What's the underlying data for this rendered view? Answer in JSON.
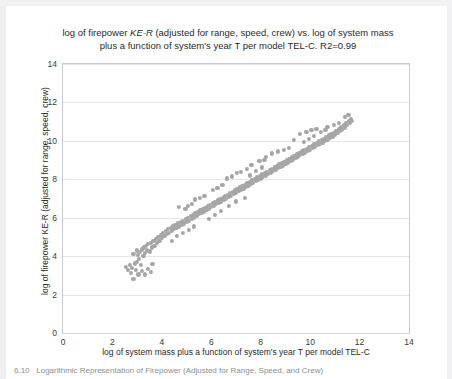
{
  "figure": {
    "title_line1_a": "log of firepower ",
    "title_line1_it": "KE-R",
    "title_line1_b": "  (adjusted for range, speed, crew) vs. log  of system mass",
    "title_line2": "plus a function of system's year T per model TEL-C. R2=0.99",
    "caption_number": "6.10",
    "caption_text": "Logarithmic Representation of Firepower (Adjusted for Range, Speed, and Crew)"
  },
  "chart_data": {
    "type": "scatter",
    "title": "log of firepower KE-R  (adjusted for range, speed, crew) vs. log  of system mass plus a function of system's year T per model TEL-C. R2=0.99",
    "xlabel": "log  of system mass plus  a function of system's year T per model TEL-C",
    "ylabel": "log of firepower KE-R  (adjusted for range, speed, crew)",
    "xlim": [
      0,
      14
    ],
    "ylim": [
      0,
      14
    ],
    "xticks": [
      0,
      2,
      4,
      6,
      8,
      10,
      12,
      14
    ],
    "yticks": [
      0,
      2,
      4,
      6,
      8,
      10,
      12,
      14
    ],
    "grid": "horizontal",
    "legend": "none",
    "marker_color": "#a6a6a6",
    "series": [
      {
        "name": "systems",
        "points": [
          [
            2.55,
            3.45
          ],
          [
            2.62,
            3.3
          ],
          [
            2.7,
            3.55
          ],
          [
            2.74,
            3.12
          ],
          [
            2.8,
            3.4
          ],
          [
            2.85,
            2.8
          ],
          [
            2.9,
            3.62
          ],
          [
            2.95,
            3.3
          ],
          [
            3.0,
            3.7
          ],
          [
            3.02,
            4.05
          ],
          [
            3.08,
            3.85
          ],
          [
            3.12,
            4.2
          ],
          [
            3.15,
            3.55
          ],
          [
            3.2,
            4.35
          ],
          [
            3.25,
            4.0
          ],
          [
            3.28,
            4.45
          ],
          [
            3.32,
            4.15
          ],
          [
            3.36,
            4.55
          ],
          [
            3.4,
            4.3
          ],
          [
            3.45,
            4.62
          ],
          [
            3.5,
            4.25
          ],
          [
            3.55,
            4.7
          ],
          [
            3.6,
            4.45
          ],
          [
            3.66,
            4.8
          ],
          [
            3.7,
            4.55
          ],
          [
            3.75,
            4.9
          ],
          [
            3.8,
            4.7
          ],
          [
            3.86,
            5.0
          ],
          [
            3.9,
            4.8
          ],
          [
            3.95,
            5.1
          ],
          [
            4.0,
            4.95
          ],
          [
            4.05,
            5.2
          ],
          [
            4.1,
            5.05
          ],
          [
            4.15,
            5.3
          ],
          [
            4.2,
            5.15
          ],
          [
            4.26,
            5.4
          ],
          [
            4.3,
            5.22
          ],
          [
            4.36,
            5.48
          ],
          [
            4.4,
            5.3
          ],
          [
            4.46,
            5.55
          ],
          [
            4.5,
            5.4
          ],
          [
            4.55,
            5.62
          ],
          [
            4.6,
            5.48
          ],
          [
            4.66,
            5.7
          ],
          [
            4.7,
            5.55
          ],
          [
            4.76,
            5.78
          ],
          [
            4.8,
            5.62
          ],
          [
            4.86,
            5.85
          ],
          [
            4.9,
            5.7
          ],
          [
            4.96,
            5.92
          ],
          [
            5.0,
            5.78
          ],
          [
            5.06,
            6.0
          ],
          [
            5.1,
            5.85
          ],
          [
            5.16,
            6.08
          ],
          [
            5.2,
            5.95
          ],
          [
            5.26,
            6.15
          ],
          [
            5.3,
            6.02
          ],
          [
            5.36,
            6.22
          ],
          [
            5.4,
            6.1
          ],
          [
            5.46,
            6.3
          ],
          [
            5.5,
            6.18
          ],
          [
            5.56,
            6.38
          ],
          [
            5.6,
            6.25
          ],
          [
            5.66,
            6.45
          ],
          [
            5.7,
            6.32
          ],
          [
            5.76,
            6.52
          ],
          [
            5.8,
            6.4
          ],
          [
            5.86,
            6.6
          ],
          [
            5.9,
            6.48
          ],
          [
            5.96,
            6.68
          ],
          [
            6.0,
            6.55
          ],
          [
            6.06,
            6.75
          ],
          [
            6.1,
            6.62
          ],
          [
            6.16,
            6.82
          ],
          [
            6.2,
            6.7
          ],
          [
            6.26,
            6.9
          ],
          [
            6.3,
            6.78
          ],
          [
            6.36,
            6.98
          ],
          [
            6.4,
            6.85
          ],
          [
            6.46,
            7.05
          ],
          [
            6.5,
            6.92
          ],
          [
            6.56,
            7.12
          ],
          [
            6.6,
            7.0
          ],
          [
            6.66,
            7.2
          ],
          [
            6.7,
            7.08
          ],
          [
            6.76,
            7.28
          ],
          [
            6.8,
            7.15
          ],
          [
            6.86,
            7.35
          ],
          [
            6.9,
            7.22
          ],
          [
            6.96,
            7.42
          ],
          [
            7.0,
            7.3
          ],
          [
            7.06,
            7.5
          ],
          [
            7.1,
            7.38
          ],
          [
            7.16,
            7.58
          ],
          [
            7.2,
            7.45
          ],
          [
            7.26,
            7.65
          ],
          [
            7.3,
            7.52
          ],
          [
            7.36,
            7.72
          ],
          [
            7.4,
            7.6
          ],
          [
            7.46,
            7.8
          ],
          [
            7.5,
            7.68
          ],
          [
            7.56,
            7.88
          ],
          [
            7.6,
            7.75
          ],
          [
            7.66,
            7.95
          ],
          [
            7.7,
            7.82
          ],
          [
            7.76,
            8.02
          ],
          [
            7.8,
            7.9
          ],
          [
            7.86,
            8.1
          ],
          [
            7.9,
            7.98
          ],
          [
            7.96,
            8.18
          ],
          [
            8.0,
            8.05
          ],
          [
            8.06,
            8.25
          ],
          [
            8.1,
            8.12
          ],
          [
            8.16,
            8.32
          ],
          [
            8.2,
            8.2
          ],
          [
            8.26,
            8.4
          ],
          [
            8.3,
            8.28
          ],
          [
            8.36,
            8.48
          ],
          [
            8.4,
            8.35
          ],
          [
            8.46,
            8.55
          ],
          [
            8.5,
            8.42
          ],
          [
            8.56,
            8.62
          ],
          [
            8.6,
            8.5
          ],
          [
            8.66,
            8.7
          ],
          [
            8.7,
            8.58
          ],
          [
            8.76,
            8.78
          ],
          [
            8.8,
            8.65
          ],
          [
            8.86,
            8.85
          ],
          [
            8.9,
            8.72
          ],
          [
            8.96,
            8.92
          ],
          [
            9.0,
            8.8
          ],
          [
            9.06,
            9.0
          ],
          [
            9.1,
            8.88
          ],
          [
            9.16,
            9.08
          ],
          [
            9.2,
            8.95
          ],
          [
            9.26,
            9.15
          ],
          [
            9.3,
            9.02
          ],
          [
            9.36,
            9.22
          ],
          [
            9.4,
            9.1
          ],
          [
            9.46,
            9.3
          ],
          [
            9.5,
            9.18
          ],
          [
            9.56,
            9.38
          ],
          [
            9.6,
            9.25
          ],
          [
            9.66,
            9.45
          ],
          [
            9.7,
            9.32
          ],
          [
            9.76,
            9.52
          ],
          [
            9.8,
            9.4
          ],
          [
            9.86,
            9.6
          ],
          [
            9.9,
            9.48
          ],
          [
            9.96,
            9.68
          ],
          [
            10.0,
            9.55
          ],
          [
            10.06,
            9.75
          ],
          [
            10.1,
            9.62
          ],
          [
            10.16,
            9.82
          ],
          [
            10.2,
            9.7
          ],
          [
            10.26,
            9.9
          ],
          [
            10.3,
            9.78
          ],
          [
            10.36,
            9.98
          ],
          [
            10.4,
            9.85
          ],
          [
            10.46,
            10.05
          ],
          [
            10.5,
            9.92
          ],
          [
            10.56,
            10.12
          ],
          [
            10.6,
            10.0
          ],
          [
            10.66,
            10.2
          ],
          [
            10.7,
            10.08
          ],
          [
            10.76,
            10.28
          ],
          [
            10.8,
            10.15
          ],
          [
            10.86,
            10.35
          ],
          [
            10.9,
            10.22
          ],
          [
            10.96,
            10.42
          ],
          [
            11.0,
            10.3
          ],
          [
            11.06,
            10.5
          ],
          [
            11.1,
            10.4
          ],
          [
            11.16,
            10.6
          ],
          [
            11.2,
            10.5
          ],
          [
            11.26,
            10.7
          ],
          [
            11.3,
            10.6
          ],
          [
            11.36,
            10.8
          ],
          [
            11.4,
            10.7
          ],
          [
            11.46,
            10.92
          ],
          [
            11.5,
            10.82
          ],
          [
            11.56,
            11.05
          ],
          [
            11.6,
            10.95
          ],
          [
            11.66,
            11.15
          ],
          [
            11.7,
            11.05
          ],
          [
            3.05,
            3.05
          ],
          [
            3.18,
            3.25
          ],
          [
            3.3,
            3.05
          ],
          [
            3.42,
            3.35
          ],
          [
            3.55,
            3.2
          ],
          [
            3.62,
            3.6
          ],
          [
            4.7,
            6.55
          ],
          [
            4.95,
            6.45
          ],
          [
            5.05,
            6.6
          ],
          [
            5.2,
            6.7
          ],
          [
            5.35,
            6.95
          ],
          [
            5.55,
            7.05
          ],
          [
            5.72,
            7.15
          ],
          [
            6.05,
            7.45
          ],
          [
            6.25,
            7.55
          ],
          [
            6.45,
            7.7
          ],
          [
            6.62,
            8.05
          ],
          [
            6.85,
            8.15
          ],
          [
            7.05,
            8.35
          ],
          [
            7.2,
            8.4
          ],
          [
            7.45,
            8.55
          ],
          [
            7.62,
            8.75
          ],
          [
            7.95,
            8.95
          ],
          [
            8.15,
            9.0
          ],
          [
            5.9,
            5.95
          ],
          [
            6.15,
            6.15
          ],
          [
            6.4,
            6.35
          ],
          [
            6.7,
            6.6
          ],
          [
            7.0,
            6.85
          ],
          [
            7.35,
            7.05
          ],
          [
            9.6,
            10.35
          ],
          [
            9.85,
            10.45
          ],
          [
            10.05,
            10.55
          ],
          [
            10.25,
            10.62
          ],
          [
            9.35,
            10.05
          ],
          [
            10.7,
            10.72
          ],
          [
            10.95,
            10.85
          ],
          [
            11.15,
            10.95
          ],
          [
            11.42,
            11.25
          ],
          [
            11.55,
            11.35
          ],
          [
            8.45,
            9.35
          ],
          [
            8.7,
            9.45
          ],
          [
            8.95,
            9.55
          ],
          [
            9.15,
            9.65
          ],
          [
            8.2,
            9.15
          ],
          [
            4.4,
            4.8
          ],
          [
            4.62,
            5.05
          ],
          [
            4.85,
            5.2
          ],
          [
            5.1,
            5.38
          ],
          [
            5.3,
            5.55
          ],
          [
            2.85,
            4.1
          ],
          [
            3.0,
            4.3
          ],
          [
            7.55,
            8.2
          ],
          [
            7.8,
            8.42
          ],
          [
            8.05,
            8.62
          ],
          [
            9.75,
            9.95
          ],
          [
            9.95,
            10.12
          ],
          [
            10.15,
            10.25
          ],
          [
            10.45,
            10.45
          ],
          [
            10.62,
            10.55
          ]
        ]
      }
    ]
  }
}
